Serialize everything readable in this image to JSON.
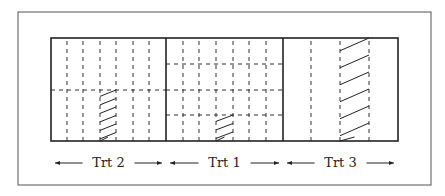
{
  "diagram": {
    "title": "",
    "treatments": [
      {
        "label": "Trt 2",
        "x0": 51,
        "x1": 166,
        "vlines": [
          67,
          83,
          100,
          116,
          133,
          149
        ],
        "hlines": [
          90
        ],
        "hatch": {
          "x0": 100,
          "x1": 116,
          "y0": 90,
          "y1": 141
        }
      },
      {
        "label": "Trt 1",
        "x0": 166,
        "x1": 283,
        "vlines": [
          183,
          199,
          216,
          233,
          249,
          266
        ],
        "hlines": [
          64,
          90,
          115
        ],
        "hatch": {
          "x0": 216,
          "x1": 233,
          "y0": 115,
          "y1": 141
        }
      },
      {
        "label": "Trt 3",
        "x0": 283,
        "x1": 398,
        "vlines": [
          311,
          340,
          369
        ],
        "hlines": [],
        "hatch": {
          "x0": 340,
          "x1": 369,
          "y0": 38,
          "y1": 141
        }
      }
    ],
    "colors": {
      "line": "#222222",
      "frame": "#555555",
      "background": "#ffffff"
    }
  }
}
